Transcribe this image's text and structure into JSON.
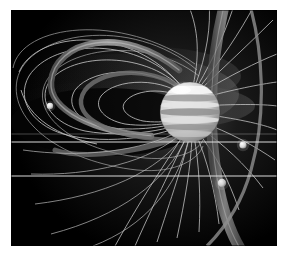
{
  "figure": {
    "caption": "",
    "background_color": "#000000",
    "page_color": "#ffffff",
    "border": {
      "left_px": 11,
      "top_px": 10,
      "width_px": 266,
      "height_px": 236
    },
    "palette": {
      "space_black": "#000000",
      "field_line": "#d8d8d8",
      "field_line_dim": "#8a8a8a",
      "torus_gray": "#6e6e6e",
      "torus_gray_bright": "#9a9a9a",
      "planet_light": "#e6e6e6",
      "planet_band_dark": "#8e8e8e",
      "moon_bright": "#f2f2f2",
      "haze": "#3a3a3a",
      "reference_line": "#e8e8e8"
    }
  },
  "scene": {
    "planet": {
      "name": "Jupiter",
      "center_x": 190,
      "center_y": 112,
      "radius": 30,
      "bands": [
        {
          "label": "polar-aurora-cap",
          "y_offset": -22,
          "height": 8,
          "shade": "#f4f4f4"
        },
        {
          "label": "north-temperate-belt",
          "y_offset": -12,
          "height": 6,
          "shade": "#a8a8a8"
        },
        {
          "label": "north-tropical-zone",
          "y_offset": -4,
          "height": 6,
          "shade": "#e0e0e0"
        },
        {
          "label": "equatorial-belt",
          "y_offset": 3,
          "height": 7,
          "shade": "#9c9c9c"
        },
        {
          "label": "south-tropical-zone",
          "y_offset": 11,
          "height": 6,
          "shade": "#dcdcdc"
        },
        {
          "label": "south-temperate-belt",
          "y_offset": 19,
          "height": 5,
          "shade": "#8e8e8e"
        }
      ]
    },
    "moons": [
      {
        "name": "outer-moon-left",
        "x": 50,
        "y": 106,
        "radius": 3.2,
        "brightness": "#e8e8e8"
      },
      {
        "name": "moon-right-bright",
        "x": 243,
        "y": 145,
        "radius": 3.6,
        "brightness": "#ffffff"
      },
      {
        "name": "moon-io-lower",
        "x": 222,
        "y": 183,
        "radius": 4.0,
        "brightness": "#b4b4b4"
      }
    ],
    "plasma_torus": {
      "name": "io-plasma-torus",
      "description": "tilted tube ring encircling the planet",
      "tilt_degrees": 10,
      "tube_width": 9
    },
    "reference_lines": [
      {
        "name": "reference-line-upper",
        "y": 142
      },
      {
        "name": "reference-line-lower",
        "y": 176
      }
    ],
    "field_lines": {
      "name": "dipole-magnetic-field-lines",
      "count_left": 10,
      "count_right": 16,
      "description": "closed dipolar loops on the left (nightside) and a radiating fan on the right (dayside)"
    },
    "plasma_sheet": {
      "name": "plasma-sheet-haze",
      "description": "diffuse gray wedge extending left from the planet"
    }
  }
}
